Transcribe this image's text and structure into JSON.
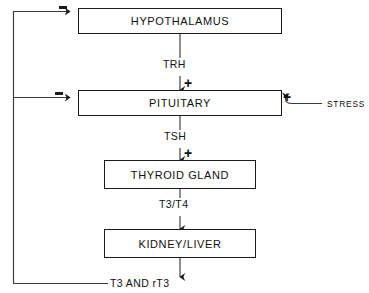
{
  "diagram": {
    "type": "flowchart",
    "nodes": [
      {
        "id": "hypothalamus",
        "label": "HYPOTHALAMUS"
      },
      {
        "id": "pituitary",
        "label": "PITUITARY"
      },
      {
        "id": "thyroid_gland",
        "label": "THYROID GLAND"
      },
      {
        "id": "kidney_liver",
        "label": "KIDNEY/LIVER"
      }
    ],
    "edge_labels": {
      "trh": "TRH",
      "tsh": "TSH",
      "t3_t4": "T3/T4",
      "output": "T3 AND rT3"
    },
    "signs": {
      "trh_plus": "+",
      "tsh_plus": "+",
      "stress_plus": "+",
      "feedback_hypothalamus_minus": "−",
      "feedback_pituitary_minus": "−"
    },
    "external_input": {
      "label": "STRESS",
      "sign": "+"
    },
    "colors": {
      "stroke": "#1a1a1a",
      "text": "#111111",
      "background": "#ffffff"
    }
  }
}
